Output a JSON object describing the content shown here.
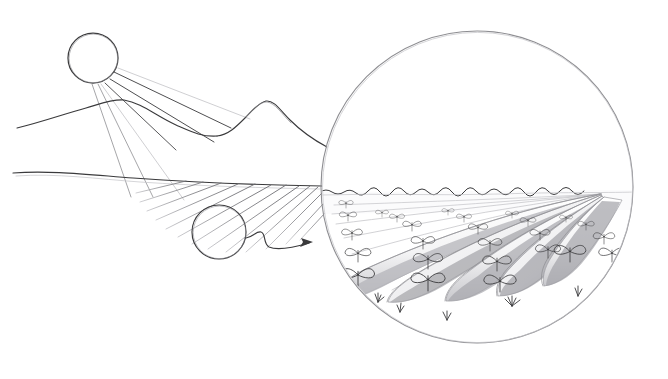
{
  "figure": {
    "medium": "pencil sketch",
    "background_color": "#ffffff",
    "ink_color": "#3a3a3c",
    "ink_soft_color": "#8e8e92",
    "ink_faint_color": "#c3c3c7",
    "width": 668,
    "height": 379
  },
  "sun": {
    "name": "sun",
    "cx": 93,
    "cy": 58,
    "r": 25,
    "ray_count": 7,
    "rays": [
      {
        "x1": 114,
        "y1": 72,
        "x2": 230,
        "y2": 128,
        "weight": "dark"
      },
      {
        "x1": 110,
        "y1": 79,
        "x2": 213,
        "y2": 142,
        "weight": "dark"
      },
      {
        "x1": 104,
        "y1": 83,
        "x2": 175,
        "y2": 150,
        "weight": "dark"
      },
      {
        "x1": 97,
        "y1": 84,
        "x2": 152,
        "y2": 195,
        "weight": "soft"
      },
      {
        "x1": 92,
        "y1": 84,
        "x2": 130,
        "y2": 196,
        "weight": "soft"
      },
      {
        "x1": 118,
        "y1": 68,
        "x2": 249,
        "y2": 119,
        "weight": "faint"
      },
      {
        "x1": 100,
        "y1": 84,
        "x2": 183,
        "y2": 200,
        "weight": "faint"
      }
    ]
  },
  "terrain": {
    "name": "mountain-range",
    "ridge_path": "M 18,127 C 40,122 62,114 84,108 C 100,104 110,100 122,100 C 140,101 152,114 172,123 C 190,131 200,136 216,136 C 230,136 240,128 252,120 C 262,113 232,102 244,101 C 246,119 262,126 280,130 C 300,135 312,140 326,144",
    "peak_left_x": 122,
    "peak_right_x": 245,
    "ground_path": "M 14,173 C 60,170 110,177 160,179 C 230,182 290,184 326,185",
    "valley_path": "M 160,179 C 200,182 250,183 300,184"
  },
  "field": {
    "name": "hatched-field",
    "hatch_line_count": 13,
    "hatch_angle_deg": 28,
    "hatch_region": {
      "x": 132,
      "y": 182,
      "width": 190,
      "height": 66
    }
  },
  "magnifier": {
    "name": "magnifier-small-circle",
    "cx": 219,
    "cy": 232,
    "r": 27
  },
  "connector": {
    "name": "connector-arrow",
    "path": "M 246,238 C 253,238 256,232 261,233 C 266,234 264,244 269,246 C 274,248 290,248 310,243",
    "arrow_tip": {
      "x": 312,
      "y": 242
    },
    "direction": "right"
  },
  "detail_circle": {
    "name": "magnified-detail-circle",
    "cx": 477,
    "cy": 187,
    "r": 156,
    "horizon_y": 192,
    "horizon_label": "wavy horizon line"
  },
  "planting_rows": {
    "name": "planting-ridges",
    "row_count": 5,
    "description": "soil ridges receding to vanishing point with paired-leaf seedlings",
    "vanishing_point": {
      "x": 600,
      "y": 193
    },
    "ridges": [
      {
        "index": 0,
        "front_x": 352,
        "front_y": 300,
        "seedlings": 5
      },
      {
        "index": 1,
        "front_x": 420,
        "front_y": 300,
        "seedlings": 6
      },
      {
        "index": 2,
        "front_x": 492,
        "front_y": 297,
        "seedlings": 6
      },
      {
        "index": 3,
        "front_x": 560,
        "front_y": 290,
        "seedlings": 5
      },
      {
        "index": 4,
        "front_x": 614,
        "front_y": 280,
        "seedlings": 4
      }
    ]
  },
  "ground_tufts": {
    "name": "grass-tufts",
    "count": 5,
    "positions": [
      {
        "x": 378,
        "y": 300
      },
      {
        "x": 400,
        "y": 310
      },
      {
        "x": 447,
        "y": 318
      },
      {
        "x": 515,
        "y": 305
      },
      {
        "x": 578,
        "y": 295
      }
    ]
  }
}
